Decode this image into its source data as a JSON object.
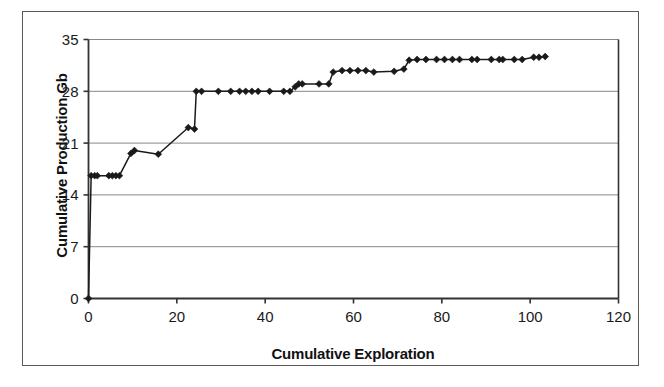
{
  "chart_data": {
    "type": "line",
    "title": "",
    "subtitle": "",
    "xlabel": "Cumulative Exploration",
    "ylabel": "Cumulative Production Gb",
    "xlim": [
      0,
      120
    ],
    "ylim": [
      0,
      35
    ],
    "xticks": [
      0,
      20,
      40,
      60,
      80,
      100,
      120
    ],
    "yticks": [
      0,
      7,
      14,
      21,
      28,
      35
    ],
    "xtick_labels": [
      "0",
      "20",
      "40",
      "60",
      "80",
      "100",
      "120"
    ],
    "ytick_labels": [
      "0",
      "7",
      "14",
      "21",
      "28",
      "35"
    ],
    "grid": "horizontal",
    "legend": "none",
    "marker": "diamond",
    "line_color": "#1a1a1a",
    "marker_color": "#1a1a1a",
    "grid_color": "#888888",
    "axis_color": "#333333",
    "background_color": "#ffffff",
    "series": [
      {
        "name": "Cumulative Production",
        "points": [
          [
            0.0,
            0.0
          ],
          [
            0.6,
            16.6
          ],
          [
            1.4,
            16.6
          ],
          [
            2.0,
            16.6
          ],
          [
            4.6,
            16.6
          ],
          [
            5.4,
            16.6
          ],
          [
            6.2,
            16.6
          ],
          [
            7.0,
            16.6
          ],
          [
            9.6,
            19.6
          ],
          [
            10.4,
            20.0
          ],
          [
            15.8,
            19.5
          ],
          [
            22.6,
            23.1
          ],
          [
            24.0,
            22.9
          ],
          [
            24.4,
            28.0
          ],
          [
            25.6,
            28.0
          ],
          [
            29.4,
            28.0
          ],
          [
            32.2,
            28.0
          ],
          [
            34.2,
            28.0
          ],
          [
            35.6,
            28.0
          ],
          [
            37.0,
            28.0
          ],
          [
            38.4,
            28.0
          ],
          [
            41.0,
            28.0
          ],
          [
            44.2,
            28.0
          ],
          [
            45.6,
            28.0
          ],
          [
            46.8,
            28.6
          ],
          [
            47.6,
            29.0
          ],
          [
            48.4,
            29.0
          ],
          [
            52.2,
            29.0
          ],
          [
            54.4,
            29.0
          ],
          [
            55.4,
            30.6
          ],
          [
            57.4,
            30.8
          ],
          [
            59.2,
            30.8
          ],
          [
            61.0,
            30.8
          ],
          [
            62.8,
            30.8
          ],
          [
            64.6,
            30.6
          ],
          [
            69.2,
            30.7
          ],
          [
            71.4,
            31.0
          ],
          [
            72.6,
            32.2
          ],
          [
            74.4,
            32.3
          ],
          [
            76.4,
            32.3
          ],
          [
            78.8,
            32.3
          ],
          [
            80.6,
            32.3
          ],
          [
            82.4,
            32.3
          ],
          [
            84.0,
            32.3
          ],
          [
            86.8,
            32.3
          ],
          [
            88.0,
            32.3
          ],
          [
            91.2,
            32.3
          ],
          [
            93.0,
            32.3
          ],
          [
            93.8,
            32.3
          ],
          [
            96.4,
            32.3
          ],
          [
            98.2,
            32.3
          ],
          [
            100.8,
            32.6
          ],
          [
            102.0,
            32.6
          ],
          [
            103.4,
            32.7
          ]
        ]
      }
    ]
  }
}
